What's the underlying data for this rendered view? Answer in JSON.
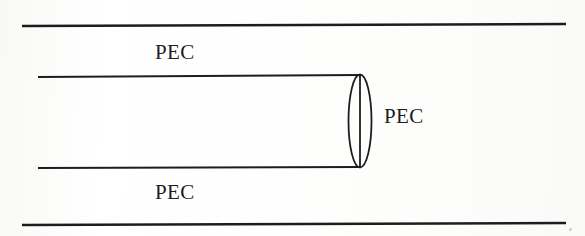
{
  "figure": {
    "background_color": "#fdfdfc",
    "ink_color": "#1d1d1f",
    "labels": {
      "top": "PEC",
      "right": "PEC",
      "bottom": "PEC"
    },
    "geometry": {
      "top_boundary_line": {
        "name": "top-outer-boundary",
        "x1": 22,
        "y1": 26,
        "x2": 566,
        "y2": 24,
        "stroke_width": 2.6
      },
      "bottom_boundary_line": {
        "name": "bottom-outer-boundary",
        "x1": 22,
        "y1": 225,
        "x2": 566,
        "y2": 223,
        "stroke_width": 2.6
      },
      "cylinder_top_line": {
        "name": "cylinder-top-wall",
        "x1": 38,
        "y1": 77,
        "x2": 360,
        "y2": 75,
        "stroke_width": 2.2
      },
      "cylinder_bottom_line": {
        "name": "cylinder-bottom-wall",
        "x1": 38,
        "y1": 168,
        "x2": 360,
        "y2": 167,
        "stroke_width": 2.2
      },
      "end_cap_ellipse": {
        "name": "cylinder-end-cap",
        "cx": 360,
        "cy": 121,
        "rx": 11.5,
        "ry": 46.5,
        "stroke_width": 1.8
      },
      "end_cap_center_line": {
        "name": "cylinder-end-cap-axis",
        "x1": 360,
        "y1": 75,
        "x2": 360,
        "y2": 168,
        "stroke_width": 1.8
      }
    }
  }
}
